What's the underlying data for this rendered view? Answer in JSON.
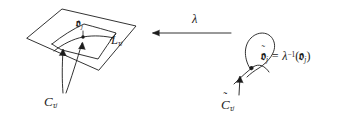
{
  "figure": {
    "name": "leaf-and-nodal-curve-diagram",
    "background_color": "#ffffff",
    "ink_color": "#1c1c1c",
    "width": 360,
    "height": 127
  },
  "left_panel": {
    "plane_label": "L",
    "plane_label_sub": "τ",
    "plane_label_subsub": "j",
    "point_label": "𝔬",
    "point_label_sub": "j",
    "curve_label": "C",
    "curve_label_sub": "τ",
    "curve_label_subsub": "j"
  },
  "map_arrow": {
    "label": "λ",
    "direction": "left"
  },
  "right_panel": {
    "node_point_label": "𝔬",
    "node_point_tilde": "˜",
    "node_point_sub": "j",
    "equals": " = ",
    "map_symbol": "λ",
    "map_exponent": "−1",
    "open_paren": "(",
    "arg_symbol": "𝔬",
    "arg_sub": "j",
    "close_paren": ")",
    "curve_label": "C",
    "curve_label_tilde": "˜",
    "curve_label_sub": "τ",
    "curve_label_subsub": "j"
  }
}
